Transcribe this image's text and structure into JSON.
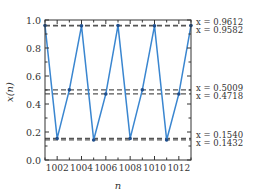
{
  "chart_data": {
    "type": "line",
    "title": "",
    "xlabel": "n",
    "ylabel": "x(n)",
    "xlim": [
      1001,
      1013
    ],
    "ylim": [
      0.0,
      1.0
    ],
    "xticks": [
      1002,
      1004,
      1006,
      1008,
      1010,
      1012
    ],
    "xtick_labels": [
      "1002",
      "1004",
      "1006",
      "1008",
      "1010",
      "1012"
    ],
    "yticks": [
      0.0,
      0.2,
      0.4,
      0.6,
      0.8,
      1.0
    ],
    "ytick_labels": [
      "0.0",
      "0.2",
      "0.4",
      "0.6",
      "0.8",
      "1.0"
    ],
    "grid": false,
    "series": [
      {
        "name": "x(n)",
        "color": "#3a86d0",
        "x": [
          1001,
          1002,
          1003,
          1004,
          1005,
          1006,
          1007,
          1008,
          1009,
          1010,
          1011,
          1012,
          1013
        ],
        "values": [
          0.9612,
          0.154,
          0.5009,
          0.9582,
          0.1432,
          0.4718,
          0.9612,
          0.154,
          0.5009,
          0.9582,
          0.1432,
          0.4718,
          0.9612
        ]
      }
    ],
    "reference_lines": [
      {
        "y": 0.9612,
        "label": "x = 0.9612"
      },
      {
        "y": 0.9582,
        "label": "x = 0.9582"
      },
      {
        "y": 0.5009,
        "label": "x = 0.5009"
      },
      {
        "y": 0.4718,
        "label": "x = 0.4718"
      },
      {
        "y": 0.154,
        "label": "x = 0.1540"
      },
      {
        "y": 0.1432,
        "label": "x = 0.1432"
      }
    ],
    "colors": {
      "line": "#3a86d0",
      "marker": "#1f4e8c",
      "dashed": "#555555",
      "axis": "#333333"
    }
  }
}
